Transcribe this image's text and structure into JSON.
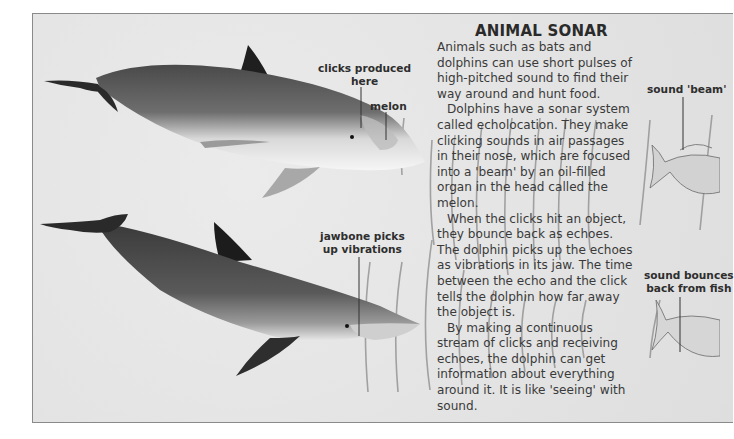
{
  "article": {
    "title": "ANIMAL SONAR",
    "paragraphs": [
      "Animals such as bats and dolphins can use short pulses of high-pitched sound to find their way around and hunt food.",
      "Dolphins have a sonar system called echolocation. They make clicking sounds in air passages in their nose, which are focused into a 'beam' by an oil-filled organ in the head called the melon.",
      "When the clicks hit an object, they bounce back as echoes. The dolphin picks up the echoes as vibrations in its jaw. The time between the echo and the click tells the dolphin how far away the object is.",
      "By making a continuous stream of clicks and receiving echoes, the dolphin can get information about everything around it. It is like 'seeing' with sound."
    ]
  },
  "labels": {
    "clicks_produced_line1": "clicks produced",
    "clicks_produced_line2": "here",
    "melon": "melon",
    "jawbone_line1": "jawbone picks",
    "jawbone_line2": "up vibrations",
    "sound_beam": "sound 'beam'",
    "sound_bounces_line1": "sound bounces",
    "sound_bounces_line2": "back from fish"
  },
  "colors": {
    "background": "#e6e6e6",
    "text": "#3a3a3a",
    "dolphin_dark": "#3c3c3c",
    "dolphin_light": "#f2f2f2"
  }
}
